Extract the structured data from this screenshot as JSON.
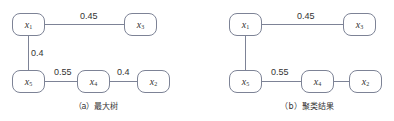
{
  "panels": [
    {
      "id": "a",
      "caption": "（a）最大树",
      "nodes": [
        {
          "id": "x1",
          "var": "x",
          "sub": "1",
          "x": 12,
          "y": 13
        },
        {
          "id": "x3",
          "var": "x",
          "sub": "3",
          "x": 124,
          "y": 13
        },
        {
          "id": "x5",
          "var": "x",
          "sub": "5",
          "x": 12,
          "y": 70
        },
        {
          "id": "x4",
          "var": "x",
          "sub": "4",
          "x": 77,
          "y": 70
        },
        {
          "id": "x2",
          "var": "x",
          "sub": "2",
          "x": 137,
          "y": 70
        }
      ],
      "edges": [
        {
          "from": "x1",
          "to": "x3",
          "weight": "0.45"
        },
        {
          "from": "x1",
          "to": "x5",
          "weight": "0.4"
        },
        {
          "from": "x5",
          "to": "x4",
          "weight": "0.55"
        },
        {
          "from": "x4",
          "to": "x2",
          "weight": "0.4"
        }
      ]
    },
    {
      "id": "b",
      "caption": "（b）聚类结果",
      "nodes": [
        {
          "id": "x1",
          "var": "x",
          "sub": "1",
          "x": 229,
          "y": 13
        },
        {
          "id": "x3",
          "var": "x",
          "sub": "3",
          "x": 343,
          "y": 13
        },
        {
          "id": "x5",
          "var": "x",
          "sub": "5",
          "x": 229,
          "y": 70
        },
        {
          "id": "x4",
          "var": "x",
          "sub": "4",
          "x": 301,
          "y": 70
        },
        {
          "id": "x2",
          "var": "x",
          "sub": "2",
          "x": 349,
          "y": 70
        }
      ],
      "edges": [
        {
          "from": "x1",
          "to": "x3",
          "weight": "0.45"
        },
        {
          "from": "x1",
          "to": "x5",
          "weight": ""
        },
        {
          "from": "x5",
          "to": "x4",
          "weight": "0.55"
        },
        {
          "from": "x4",
          "to": "x2",
          "weight": ""
        }
      ]
    }
  ],
  "colors": {
    "border": "#7d8396",
    "edge": "#7d8396",
    "text": "#333333"
  }
}
